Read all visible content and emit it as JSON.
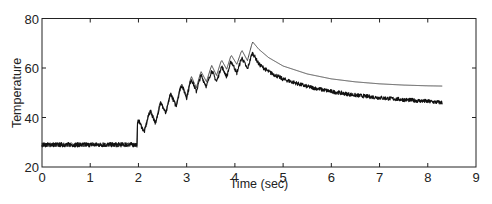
{
  "chart_data": {
    "type": "line",
    "title": "",
    "xlabel": "Time (sec)",
    "ylabel": "Temperature",
    "xlim": [
      0,
      9
    ],
    "ylim": [
      20,
      80
    ],
    "xticks": [
      "0",
      "1",
      "2",
      "3",
      "4",
      "5",
      "6",
      "7",
      "8",
      "9"
    ],
    "yticks": [
      "20",
      "40",
      "60",
      "80"
    ],
    "grid": false,
    "legend": null,
    "box": true,
    "series": [
      {
        "name": "smooth (model)",
        "style": "thin line",
        "color": "#333333",
        "x": [
          0.0,
          1.97,
          1.98,
          2.0,
          2.12,
          2.22,
          2.25,
          2.36,
          2.44,
          2.46,
          2.57,
          2.65,
          2.67,
          2.78,
          2.87,
          2.9,
          3.0,
          3.08,
          3.1,
          3.2,
          3.28,
          3.3,
          3.41,
          3.5,
          3.52,
          3.62,
          3.71,
          3.73,
          3.83,
          3.91,
          3.93,
          4.04,
          4.13,
          4.15,
          4.26,
          4.35,
          4.37,
          4.5,
          4.7,
          5.0,
          5.5,
          6.0,
          6.5,
          7.0,
          7.5,
          8.0,
          8.3
        ],
        "y": [
          29,
          29,
          37,
          39,
          34.5,
          42,
          43,
          38,
          45.5,
          46.5,
          42,
          49,
          50,
          45,
          52.5,
          53.5,
          48.5,
          55.5,
          56.5,
          52,
          57.5,
          58.5,
          54.5,
          60,
          61,
          57,
          62.5,
          63,
          59.5,
          64.5,
          65,
          61.5,
          66.5,
          67,
          63,
          69.5,
          70.5,
          67.5,
          64.2,
          60.8,
          57.6,
          55.6,
          54.4,
          53.6,
          53.1,
          52.8,
          52.7
        ]
      },
      {
        "name": "measured (noisy)",
        "style": "noisy line",
        "color": "#111111",
        "x": [
          0.0,
          1.97,
          1.98,
          2.0,
          2.12,
          2.22,
          2.25,
          2.36,
          2.44,
          2.46,
          2.57,
          2.65,
          2.67,
          2.78,
          2.87,
          2.9,
          3.0,
          3.08,
          3.1,
          3.2,
          3.28,
          3.3,
          3.41,
          3.5,
          3.52,
          3.62,
          3.71,
          3.73,
          3.83,
          3.91,
          3.93,
          4.04,
          4.13,
          4.15,
          4.26,
          4.35,
          4.37,
          4.5,
          4.7,
          5.0,
          5.5,
          6.0,
          6.5,
          7.0,
          7.5,
          8.0,
          8.3
        ],
        "y": [
          29,
          29,
          37,
          39,
          34,
          41.5,
          42.5,
          37.5,
          45,
          46,
          41.5,
          48.5,
          49.5,
          44.5,
          52,
          53,
          48,
          54.5,
          55.5,
          50.5,
          56,
          57,
          52.5,
          58,
          59,
          54.5,
          60,
          60.5,
          56.5,
          62,
          62.5,
          58,
          63.5,
          64,
          59.5,
          65.5,
          66,
          61.5,
          58.5,
          55.5,
          52.5,
          50.5,
          49,
          48,
          47.2,
          46.5,
          46
        ]
      }
    ]
  },
  "axes": {
    "xlabel": "Time (sec)",
    "ylabel": "Temperature",
    "xtick_labels": [
      "0",
      "1",
      "2",
      "3",
      "4",
      "5",
      "6",
      "7",
      "8",
      "9"
    ],
    "ytick_labels": [
      "20",
      "40",
      "60",
      "80"
    ]
  }
}
